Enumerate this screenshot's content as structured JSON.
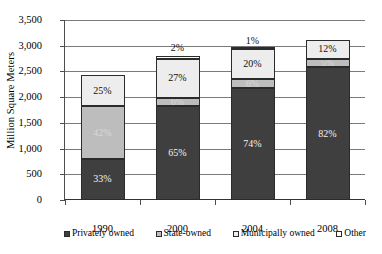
{
  "chart_data": {
    "type": "bar",
    "subtype": "stacked-bar",
    "title": "",
    "xlabel": "",
    "ylabel": "Million Square Meters",
    "ylim": [
      0,
      3500
    ],
    "ytick_step": 500,
    "grid": true,
    "legend_position": "bottom",
    "categories": [
      "1990",
      "2000",
      "2004",
      "2008"
    ],
    "ytick_labels": [
      "0",
      "500",
      "1,000",
      "1,500",
      "2,000",
      "2,500",
      "3,000",
      "3,500"
    ],
    "ytick_values": [
      0,
      500,
      1000,
      1500,
      2000,
      2500,
      3000,
      3500
    ],
    "series": [
      {
        "name": "Privately owned",
        "key": "private",
        "color": "#3f3f3f",
        "percent_labels": [
          "33%",
          "65%",
          "74%",
          "82%"
        ],
        "percents": [
          33,
          65,
          74,
          82
        ],
        "values": [
          802,
          1820,
          2176,
          2583
        ]
      },
      {
        "name": "State-owned",
        "key": "state",
        "color": "#bdbdbd",
        "percent_labels": [
          "42%",
          "6%",
          "6%",
          "5%"
        ],
        "percents": [
          42,
          6,
          6,
          5
        ],
        "values": [
          1021,
          168,
          176,
          158
        ]
      },
      {
        "name": "Municipally owned",
        "key": "muni",
        "color": "#ededed",
        "percent_labels": [
          "25%",
          "27%",
          "20%",
          "12%"
        ],
        "percents": [
          25,
          27,
          20,
          12
        ],
        "values": [
          608,
          756,
          588,
          378
        ]
      },
      {
        "name": "Other",
        "key": "other",
        "color": "#fbfbfb",
        "percent_labels": [
          "",
          "2%",
          "1%",
          ""
        ],
        "percents": [
          0,
          2,
          1,
          0
        ],
        "values": [
          0,
          56,
          29,
          0
        ]
      }
    ],
    "totals": [
      2430,
      2800,
      2940,
      3150
    ]
  },
  "legend": {
    "items": [
      {
        "label": "Privately owned",
        "key": "private"
      },
      {
        "label": "State-owned",
        "key": "state"
      },
      {
        "label": "Municipally owned",
        "key": "muni"
      },
      {
        "label": "Other",
        "key": "other"
      }
    ]
  }
}
